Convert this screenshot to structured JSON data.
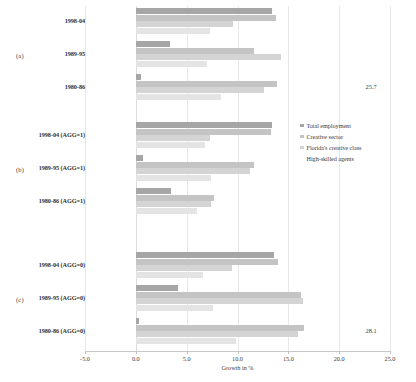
{
  "chart_data": {
    "type": "bar",
    "orientation": "horizontal",
    "title": "",
    "xlabel": "Growth in %",
    "ylabel": "",
    "xlim": [
      -5.0,
      25.0
    ],
    "xticks": [
      "-5.0",
      "0.0",
      "5.0",
      "10.0",
      "15.0",
      "20.0",
      "25.0"
    ],
    "xtick_values": [
      -5.0,
      0.0,
      5.0,
      10.0,
      15.0,
      20.0,
      25.0
    ],
    "grid": true,
    "legend_position": "right",
    "series": [
      {
        "name": "Total employment",
        "color": "#a6a6a6"
      },
      {
        "name": "Creative sector",
        "color": "#c4c4c4"
      },
      {
        "name": "Florida's creative class",
        "color": "#d4d4d4"
      },
      {
        "name": "High-skilled agents",
        "color": "#e4e4e4"
      }
    ],
    "panels": [
      {
        "letter": "(a)",
        "categories": [
          "1998-04",
          "1989-95",
          "1980-86"
        ],
        "groups": [
          {
            "label": "1998-04",
            "values": [
              13.4,
              13.8,
              9.6,
              7.3
            ],
            "overflow_label": ""
          },
          {
            "label": "1989-95",
            "values": [
              3.4,
              11.6,
              14.3,
              7.0
            ],
            "overflow_label": ""
          },
          {
            "label": "1980-86",
            "values": [
              0.5,
              13.9,
              12.6,
              8.4
            ],
            "overflow_label": "25.7"
          }
        ]
      },
      {
        "letter": "(b)",
        "categories": [
          "1998-04 (AGG=1)",
          "1989-95 (AGG=1)",
          "1980-86 (AGG=1)"
        ],
        "groups": [
          {
            "label": "1998-04 (AGG=1)",
            "values": [
              13.4,
              13.3,
              7.3,
              6.8
            ],
            "overflow_label": ""
          },
          {
            "label": "1989-95 (AGG=1)",
            "values": [
              0.7,
              11.6,
              11.2,
              7.4
            ],
            "overflow_label": ""
          },
          {
            "label": "1980-86 (AGG=1)",
            "values": [
              3.5,
              7.7,
              7.4,
              6.0
            ],
            "overflow_label": ""
          }
        ]
      },
      {
        "letter": "(c)",
        "categories": [
          "1998-04 (AGG=0)",
          "1989-95 (AGG=0)",
          "1980-86 (AGG=0)"
        ],
        "groups": [
          {
            "label": "1998-04 (AGG=0)",
            "values": [
              13.6,
              14.0,
              9.5,
              6.6
            ],
            "overflow_label": ""
          },
          {
            "label": "1989-95 (AGG=0)",
            "values": [
              4.1,
              16.2,
              16.4,
              7.6
            ],
            "overflow_label": ""
          },
          {
            "label": "1980-86 (AGG=0)",
            "values": [
              0.3,
              16.5,
              16.0,
              9.9
            ],
            "overflow_label": "28.1"
          }
        ]
      }
    ]
  }
}
